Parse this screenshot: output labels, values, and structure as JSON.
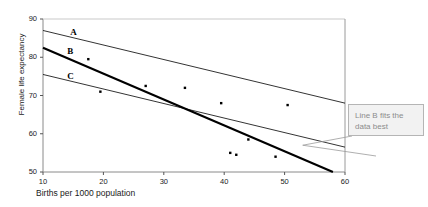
{
  "chart_data": {
    "type": "scatter",
    "title": "",
    "xlabel": "Births per 1000 population",
    "ylabel": "Female life expectancy",
    "xlim": [
      10,
      60
    ],
    "ylim": [
      50,
      90
    ],
    "xticks": [
      10,
      20,
      30,
      40,
      50,
      60
    ],
    "yticks": [
      50,
      60,
      70,
      80,
      90
    ],
    "grid": false,
    "legend": "none",
    "points": [
      {
        "x": 17.5,
        "y": 79.5
      },
      {
        "x": 19.5,
        "y": 71.0
      },
      {
        "x": 27.0,
        "y": 72.5
      },
      {
        "x": 33.5,
        "y": 72.0
      },
      {
        "x": 39.5,
        "y": 68.0
      },
      {
        "x": 44.0,
        "y": 58.5
      },
      {
        "x": 41.0,
        "y": 55.0
      },
      {
        "x": 42.0,
        "y": 54.5
      },
      {
        "x": 48.5,
        "y": 54.0
      },
      {
        "x": 50.5,
        "y": 67.5
      }
    ],
    "lines": [
      {
        "name": "A",
        "style": "thin",
        "x0": 10,
        "y0": 87.0,
        "x1": 60,
        "y1": 68.0
      },
      {
        "name": "B",
        "style": "thick",
        "x0": 10,
        "y0": 82.5,
        "x1": 58,
        "y1": 50.0
      },
      {
        "name": "C",
        "style": "thin",
        "x0": 10,
        "y0": 75.5,
        "x1": 60,
        "y1": 56.5
      }
    ],
    "line_labels": [
      {
        "text": "A",
        "x": 15.0,
        "y": 86.0
      },
      {
        "text": "B",
        "x": 14.5,
        "y": 81.0
      },
      {
        "text": "C",
        "x": 14.5,
        "y": 74.5
      }
    ]
  },
  "annotation": {
    "text": "Line B fits the data best",
    "anchor_x": 53.0,
    "anchor_y": 57.0
  },
  "axes": {
    "y_tick_labels": [
      "90",
      "80",
      "70",
      "60",
      "50"
    ],
    "x_tick_labels": [
      "10",
      "20",
      "30",
      "40",
      "50",
      "60"
    ]
  }
}
